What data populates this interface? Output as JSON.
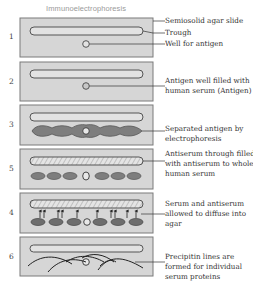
{
  "title": "Immunoelectrophoresis",
  "colors": {
    "slide_fill": "#d6d6d6",
    "slide_border": "#7a7a7a",
    "trough_fill": "#e2e2e2",
    "antigen_band": "#7a7a7a",
    "line": "#333333"
  },
  "steps": [
    {
      "number": "1",
      "labels": [
        "Semiosolid agar slide",
        "Trough",
        "Well for antigen"
      ]
    },
    {
      "number": "2",
      "labels": [
        "Antigen well filled with",
        "human serum (Antigen)"
      ]
    },
    {
      "number": "3",
      "labels": [
        "Separated antigen by",
        "electrophoresis"
      ]
    },
    {
      "number": "5",
      "labels": [
        "Antiserum through filled",
        "with antiserum to whole",
        "human serum"
      ]
    },
    {
      "number": "4",
      "labels": [
        "Serum and antiserum",
        "allowed to diffuse into",
        "agar"
      ]
    },
    {
      "number": "6",
      "labels": [
        "Precipitin lines are",
        "formed for individual",
        "serum proteins"
      ]
    }
  ]
}
